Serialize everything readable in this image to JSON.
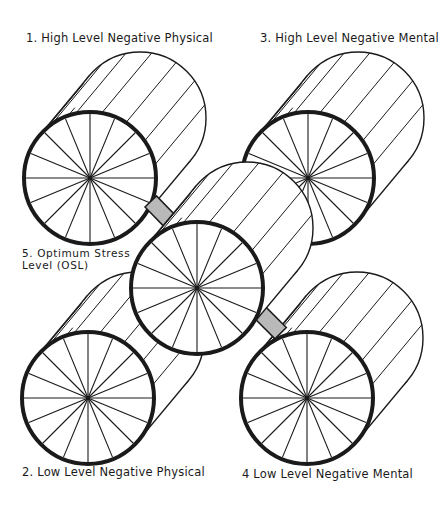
{
  "diagram": {
    "type": "stress-level-wheels",
    "ink_color": "#1a1a1a",
    "shade_color": "#b9b9b9",
    "spokes_per_wheel": 16,
    "cylinder_offset": {
      "dx": 50,
      "dy": -60
    },
    "wheel_radius": 66,
    "wheels": [
      {
        "id": "1",
        "label": "1. High Level Negative Physical",
        "cx": 90,
        "cy": 178
      },
      {
        "id": "3",
        "label": "3. High Level Negative Mental",
        "cx": 308,
        "cy": 178
      },
      {
        "id": "2",
        "label": "2. Low Level Negative Physical",
        "cx": 88,
        "cy": 398
      },
      {
        "id": "4",
        "label": "4 Low Level Negative Mental",
        "cx": 307,
        "cy": 398
      },
      {
        "id": "5",
        "label": "5. Optimum Stress\nLevel (OSL)",
        "cx": 197,
        "cy": 288
      }
    ],
    "connectors": [
      {
        "from": "1",
        "to": "5",
        "shaded": true
      },
      {
        "from": "3",
        "to": "5",
        "shaded": false
      },
      {
        "from": "2",
        "to": "5",
        "shaded": false
      },
      {
        "from": "4",
        "to": "5",
        "shaded": true
      }
    ]
  },
  "labels": {
    "wheel1": "1. High Level Negative Physical",
    "wheel3": "3. High Level Negative Mental",
    "wheel5": "5. Optimum Stress\nLevel (OSL)",
    "wheel2": "2. Low Level Negative Physical",
    "wheel4": "4 Low Level Negative Mental"
  }
}
